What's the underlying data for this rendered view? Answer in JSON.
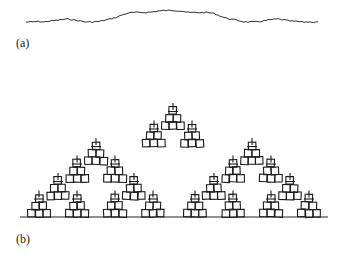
{
  "figure": {
    "panel_a": {
      "label": "(a)",
      "curve_points": [
        [
          26,
          22
        ],
        [
          32,
          22
        ],
        [
          38,
          21.5
        ],
        [
          44,
          22
        ],
        [
          50,
          21
        ],
        [
          56,
          20.5
        ],
        [
          62,
          19.5
        ],
        [
          68,
          19
        ],
        [
          74,
          20
        ],
        [
          80,
          21
        ],
        [
          86,
          22
        ],
        [
          92,
          22
        ],
        [
          98,
          21.5
        ],
        [
          104,
          20.5
        ],
        [
          110,
          19
        ],
        [
          116,
          17.5
        ],
        [
          122,
          15
        ],
        [
          128,
          13
        ],
        [
          134,
          12.5
        ],
        [
          140,
          12.5
        ],
        [
          146,
          12.5
        ],
        [
          152,
          12
        ],
        [
          158,
          11
        ],
        [
          164,
          10.5
        ],
        [
          170,
          10.5
        ],
        [
          176,
          10.5
        ],
        [
          182,
          11
        ],
        [
          188,
          12.5
        ],
        [
          194,
          12.5
        ],
        [
          200,
          12.5
        ],
        [
          206,
          12.5
        ],
        [
          212,
          13
        ],
        [
          218,
          15
        ],
        [
          224,
          17.5
        ],
        [
          230,
          19
        ],
        [
          236,
          20
        ],
        [
          242,
          21.5
        ],
        [
          248,
          22
        ],
        [
          254,
          22
        ],
        [
          260,
          21.5
        ],
        [
          266,
          20.5
        ],
        [
          272,
          19.5
        ],
        [
          278,
          19
        ],
        [
          284,
          20
        ],
        [
          290,
          21
        ],
        [
          296,
          21.5
        ],
        [
          302,
          22
        ],
        [
          308,
          22
        ],
        [
          314,
          22
        ],
        [
          318,
          22
        ]
      ],
      "stroke_color": "#333333"
    },
    "panel_b": {
      "label": "(b)",
      "baseline": {
        "x1": 20,
        "x2": 328,
        "y": 217
      },
      "apex": [
        173,
        77
      ],
      "cell_size": 7.5,
      "center_gap": [
        166,
        180
      ],
      "stroke_color": "#1a1a1a"
    }
  }
}
